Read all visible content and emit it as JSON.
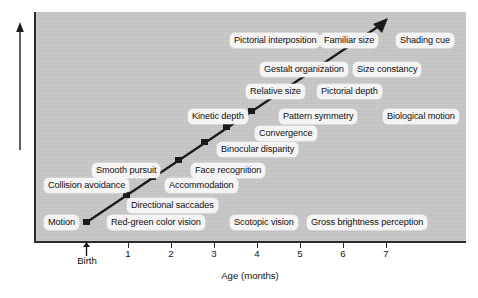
{
  "figure": {
    "background_color": "#ffffff",
    "panel_color": "#c9c9c9",
    "axis_color": "#2a2a2a",
    "label_background": "#f4f4f4"
  },
  "axes": {
    "y_label": "Visual competence",
    "x_label": "Age (months)",
    "x_ticks": [
      "1",
      "2",
      "3",
      "4",
      "5",
      "6",
      "7"
    ],
    "birth_label": "Birth"
  },
  "chart_data": {
    "type": "scatter",
    "title": "",
    "xlabel": "Age (months)",
    "ylabel": "Visual competence",
    "xlim": [
      0,
      8
    ],
    "ylim": [
      0,
      10
    ],
    "grid": false,
    "legend": null,
    "x_tick_labels": [
      "1",
      "2",
      "3",
      "4",
      "5",
      "6",
      "7"
    ],
    "x_origin_label": "Birth",
    "series": [
      {
        "name": "Visual competence trend",
        "type": "line",
        "x": [
          0.0,
          7.0
        ],
        "y": [
          0.3,
          9.6
        ],
        "note": "straight increasing trend line with arrowhead at upper right"
      }
    ],
    "markers": [
      {
        "label": "Motion",
        "x": 0.05,
        "y": 0.35
      },
      {
        "label": "Directional saccades",
        "x": 0.95,
        "y": 1.6
      },
      {
        "label": "Accommodation",
        "x": 1.55,
        "y": 2.5
      },
      {
        "label": "Face recognition",
        "x": 2.15,
        "y": 3.3
      },
      {
        "label": "Binocular disparity",
        "x": 2.75,
        "y": 4.2
      },
      {
        "label": "Convergence",
        "x": 3.25,
        "y": 4.9
      },
      {
        "label": "Pattern symmetry",
        "x": 3.8,
        "y": 5.7
      },
      {
        "label": "Pictorial depth",
        "x": 4.5,
        "y": 6.6
      },
      {
        "label": "Size constancy",
        "x": 5.3,
        "y": 7.7
      },
      {
        "label": "Shading cue",
        "x": 6.3,
        "y": 9.0
      }
    ],
    "annotations": [
      "Pictorial interposition",
      "Familiar size",
      "Shading cue",
      "Gestalt organization",
      "Size constancy",
      "Relative size",
      "Pictorial depth",
      "Kinetic depth",
      "Pattern symmetry",
      "Biological motion",
      "Convergence",
      "Binocular disparity",
      "Smooth pursuit",
      "Face recognition",
      "Collision avoidance",
      "Accommodation",
      "Directional saccades",
      "Motion",
      "Red-green color vision",
      "Scotopic vision",
      "Gross brightness perception"
    ]
  },
  "milestones": [
    {
      "id": "pictorial-interposition",
      "text": "Pictorial interposition",
      "left": 228,
      "top": 33
    },
    {
      "id": "familiar-size",
      "text": "Familiar size",
      "left": 318,
      "top": 33
    },
    {
      "id": "shading-cue",
      "text": "Shading cue",
      "left": 394,
      "top": 33
    },
    {
      "id": "gestalt-organization",
      "text": "Gestalt organization",
      "left": 258,
      "top": 62
    },
    {
      "id": "size-constancy",
      "text": "Size constancy",
      "left": 351,
      "top": 62
    },
    {
      "id": "relative-size",
      "text": "Relative size",
      "left": 244,
      "top": 84
    },
    {
      "id": "pictorial-depth",
      "text": "Pictorial depth",
      "left": 315,
      "top": 84
    },
    {
      "id": "kinetic-depth",
      "text": "Kinetic depth",
      "left": 186,
      "top": 109
    },
    {
      "id": "pattern-symmetry",
      "text": "Pattern symmetry",
      "left": 277,
      "top": 109
    },
    {
      "id": "biological-motion",
      "text": "Biological motion",
      "left": 381,
      "top": 109
    },
    {
      "id": "convergence",
      "text": "Convergence",
      "left": 253,
      "top": 126
    },
    {
      "id": "binocular-disparity",
      "text": "Binocular disparity",
      "left": 215,
      "top": 142
    },
    {
      "id": "smooth-pursuit",
      "text": "Smooth pursuit",
      "left": 90,
      "top": 163
    },
    {
      "id": "face-recognition",
      "text": "Face recognition",
      "left": 189,
      "top": 163
    },
    {
      "id": "collision-avoidance",
      "text": "Collision avoidance",
      "left": 42,
      "top": 178
    },
    {
      "id": "accommodation",
      "text": "Accommodation",
      "left": 163,
      "top": 178
    },
    {
      "id": "directional-saccades",
      "text": "Directional saccades",
      "left": 125,
      "top": 198
    },
    {
      "id": "motion",
      "text": "Motion",
      "left": 42,
      "top": 215
    },
    {
      "id": "red-green-color-vision",
      "text": "Red-green color vision",
      "left": 105,
      "top": 215
    },
    {
      "id": "scotopic-vision",
      "text": "Scotopic vision",
      "left": 228,
      "top": 215
    },
    {
      "id": "gross-brightness-perception",
      "text": "Gross brightness perception",
      "left": 305,
      "top": 215
    }
  ]
}
